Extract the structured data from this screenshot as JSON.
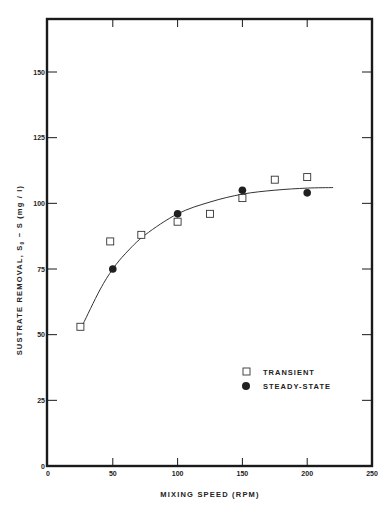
{
  "chart_data": {
    "type": "scatter",
    "title": "",
    "xlabel": "MIXING SPEED (RPM)",
    "ylabel": "SUSTRATE REMOVAL, S0 - S (mg/l)",
    "xlim": [
      0,
      250
    ],
    "ylim": [
      0,
      170
    ],
    "x_ticks": [
      0,
      50,
      100,
      150,
      200,
      250
    ],
    "y_ticks": [
      0,
      25,
      50,
      75,
      100,
      125,
      150
    ],
    "x_tick_labels": [
      "0",
      "50",
      "100",
      "150",
      "200",
      "250"
    ],
    "y_tick_labels": [
      "0",
      "25",
      "50",
      "75",
      "100",
      "125",
      "150"
    ],
    "grid": false,
    "legend_position": "lower right",
    "series": [
      {
        "name": "TRANSIENT",
        "marker": "open-square",
        "points": [
          {
            "x": 25,
            "y": 53
          },
          {
            "x": 48,
            "y": 85.5
          },
          {
            "x": 72,
            "y": 88
          },
          {
            "x": 100,
            "y": 93
          },
          {
            "x": 125,
            "y": 96
          },
          {
            "x": 150,
            "y": 102
          },
          {
            "x": 175,
            "y": 109
          },
          {
            "x": 200,
            "y": 110
          }
        ]
      },
      {
        "name": "STEADY-STATE",
        "marker": "filled-circle",
        "points": [
          {
            "x": 50,
            "y": 75
          },
          {
            "x": 100,
            "y": 96
          },
          {
            "x": 150,
            "y": 105
          },
          {
            "x": 200,
            "y": 104
          }
        ]
      },
      {
        "name": "fitted-curve",
        "marker": "line",
        "points": [
          {
            "x": 27,
            "y": 54
          },
          {
            "x": 40,
            "y": 67
          },
          {
            "x": 50,
            "y": 75
          },
          {
            "x": 60,
            "y": 81
          },
          {
            "x": 75,
            "y": 88
          },
          {
            "x": 100,
            "y": 96
          },
          {
            "x": 125,
            "y": 100.5
          },
          {
            "x": 150,
            "y": 103.5
          },
          {
            "x": 175,
            "y": 105
          },
          {
            "x": 200,
            "y": 105.8
          },
          {
            "x": 220,
            "y": 106
          }
        ]
      }
    ]
  },
  "axes": {
    "x_title": "MIXING  SPEED  (RPM)",
    "y_title_main": "SUSTRATE   REMOVAL,  S",
    "y_title_sub": "0",
    "y_title_tail": " − S   (mg / l)"
  },
  "legend": {
    "items": [
      {
        "label": "TRANSIENT",
        "marker": "open-square"
      },
      {
        "label": "STEADY-STATE",
        "marker": "filled-circle"
      }
    ]
  }
}
